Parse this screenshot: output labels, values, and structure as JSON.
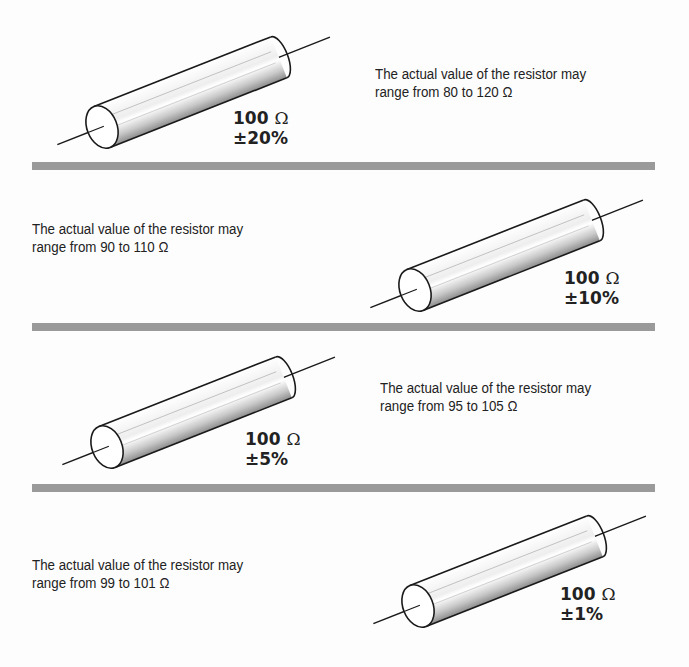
{
  "panels": [
    {
      "description_line1": "The actual value of the resistor may",
      "description_line2": "range from 80 to 120 Ω",
      "nominal": "100",
      "unit": "Ω",
      "tolerance": "±20%",
      "range_min": 80,
      "range_max": 120
    },
    {
      "description_line1": "The actual value of the resistor may",
      "description_line2": "range  from  90 to 110 Ω",
      "nominal": "100",
      "unit": "Ω",
      "tolerance": "±10%",
      "range_min": 90,
      "range_max": 110
    },
    {
      "description_line1": "The actual value of the resistor may",
      "description_line2": "range from 95 to 105 Ω",
      "nominal": "100",
      "unit": "Ω",
      "tolerance": "±5%",
      "range_min": 95,
      "range_max": 105
    },
    {
      "description_line1": "The actual value of the resistor may",
      "description_line2": "range from 99 to 101 Ω",
      "nominal": "100",
      "unit": "Ω",
      "tolerance": "±1%",
      "range_min": 99,
      "range_max": 101
    }
  ],
  "colors": {
    "divider": "#9a9a9a",
    "outline": "#1a1a1a",
    "shade": "#8c8c8c"
  }
}
